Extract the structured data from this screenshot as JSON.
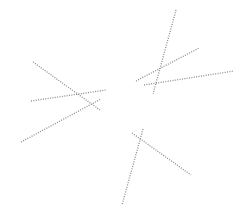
{
  "canvas": {
    "width": 251,
    "height": 222,
    "background": "#ffffff",
    "line_color": "#8a8a8a",
    "line_style": "dotted"
  },
  "clusters": [
    {
      "name": "left",
      "segments": [
        {
          "id": "A",
          "x1": 33,
          "y1": 62,
          "x2": 100,
          "y2": 110
        },
        {
          "id": "B",
          "x1": 31,
          "y1": 101,
          "x2": 106,
          "y2": 90
        },
        {
          "id": "C",
          "x1": 21,
          "y1": 142,
          "x2": 101,
          "y2": 99
        }
      ]
    },
    {
      "name": "top-right",
      "segments": [
        {
          "id": "D",
          "x1": 176,
          "y1": 10,
          "x2": 153,
          "y2": 94
        },
        {
          "id": "E",
          "x1": 136,
          "y1": 81,
          "x2": 199,
          "y2": 48
        },
        {
          "id": "F",
          "x1": 144,
          "y1": 85,
          "x2": 234,
          "y2": 71
        }
      ]
    },
    {
      "name": "bottom",
      "segments": [
        {
          "id": "G",
          "x1": 132,
          "y1": 133,
          "x2": 191,
          "y2": 175
        },
        {
          "id": "H",
          "x1": 143,
          "y1": 129,
          "x2": 122,
          "y2": 205
        }
      ]
    }
  ]
}
